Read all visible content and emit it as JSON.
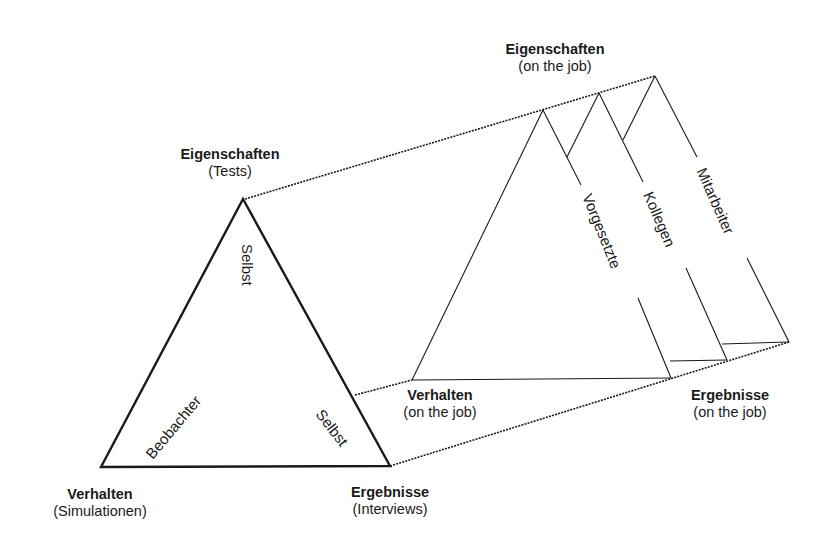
{
  "diagram": {
    "left_triangle": {
      "top": {
        "title": "Eigenschaften",
        "subtitle": "(Tests)"
      },
      "bottom_left": {
        "title": "Verhalten",
        "subtitle": "(Simulationen)"
      },
      "bottom_right": {
        "title": "Ergebnisse",
        "subtitle": "(Interviews)"
      },
      "edge_labels": {
        "vertical": "Selbst",
        "left_edge": "Beobachter",
        "right_edge": "Selbst"
      }
    },
    "right_prism": {
      "top": {
        "title": "Eigenschaften",
        "subtitle": "(on the job)"
      },
      "bottom_left": {
        "title": "Verhalten",
        "subtitle": "(on the job)"
      },
      "bottom_right": {
        "title": "Ergebnisse",
        "subtitle": "(on the job)"
      },
      "sources": [
        "Vorgesetzte",
        "Kollegen",
        "Mitarbeiter"
      ]
    },
    "colors": {
      "line": "#1a1a1a",
      "background": "#ffffff"
    }
  }
}
